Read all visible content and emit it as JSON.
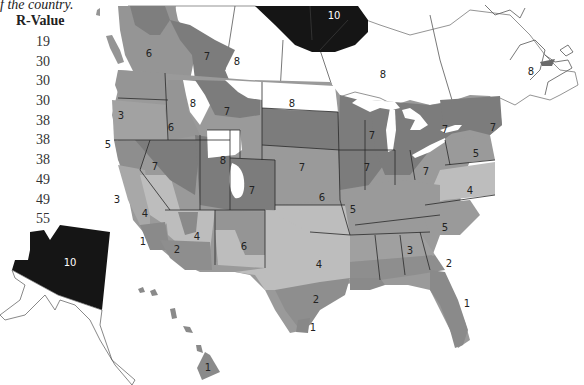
{
  "legend": {
    "caption": "f the country.",
    "header": "R-Value",
    "values": [
      "19",
      "30",
      "30",
      "30",
      "38",
      "38",
      "38",
      "49",
      "49",
      "55"
    ]
  },
  "map": {
    "colors": {
      "zone_1": "#8a8a8a",
      "zone_2": "#8e8e8e",
      "zone_3": "#a0a0a0",
      "zone_4": "#bdbdbd",
      "zone_5": "#9a9a9a",
      "zone_6": "#959595",
      "zone_7": "#7c7c7c",
      "zone_8": "#ffffff",
      "zone_10": "#151515",
      "border": "#2a2a2a"
    },
    "labels": {
      "canada_north": "10",
      "bc": "6",
      "alberta": "7",
      "saskatchewan": "8",
      "ontario": "8",
      "quebec": "8",
      "washington_north": "6",
      "idaho_north": "8",
      "montana": "7",
      "north_dakota": "8",
      "oregon": "3",
      "idaho": "6",
      "california_north": "5",
      "nevada": "7",
      "wyoming": "8",
      "colorado": "7",
      "nebraska": "7",
      "minnesota_wisconsin": "7",
      "michigan": "7",
      "new_york": "7",
      "new_england": "7",
      "iowa_illinois": "7",
      "ohio": "7",
      "pennsylvania": "5",
      "kansas": "6",
      "missouri": "5",
      "virginia": "4",
      "california_central": "3",
      "california_east": "4",
      "arizona": "4",
      "new_mexico": "6",
      "socal": "1",
      "arizona_south": "2",
      "texas_north": "4",
      "carolinas": "5",
      "alabama": "3",
      "georgia": "2",
      "texas_south": "2",
      "texas_tip": "1",
      "florida": "1",
      "alaska": "10",
      "hawaii": "1"
    }
  }
}
